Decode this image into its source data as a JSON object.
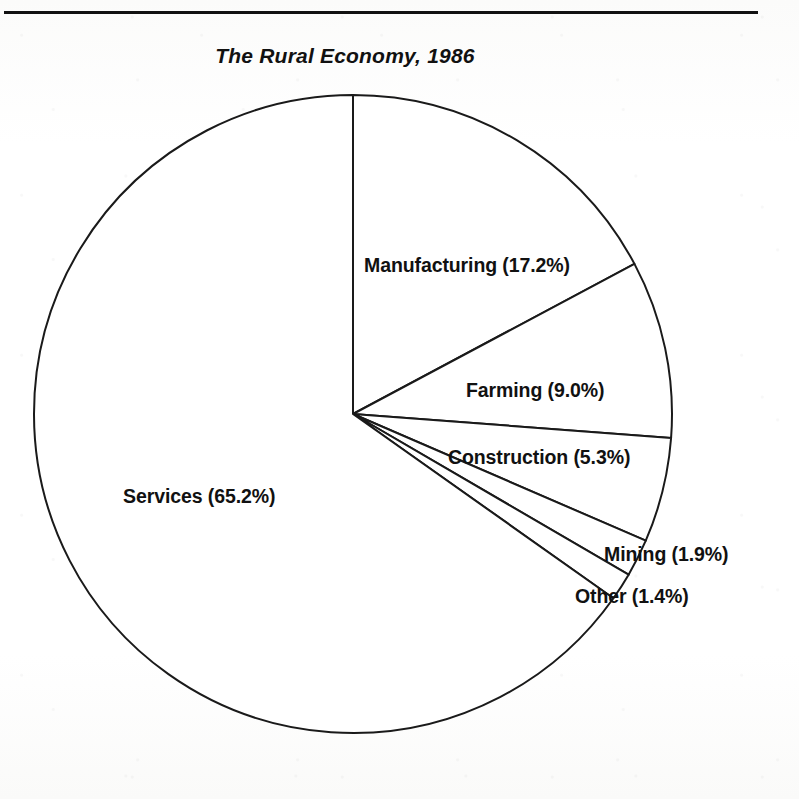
{
  "page": {
    "background_color": "#fdfdfc",
    "ink_color": "#111111",
    "top_rule": "horizontal-rule"
  },
  "chart_data": {
    "type": "pie",
    "title": "The Rural Economy, 1986",
    "xlabel": "",
    "ylabel": "",
    "grid": false,
    "legend_position": "none",
    "labels_inline": true,
    "units": "percent",
    "start_angle_deg": 0,
    "direction": "clockwise",
    "center": {
      "x": 353,
      "y": 414
    },
    "radius": 319,
    "categories": [
      "Manufacturing",
      "Farming",
      "Construction",
      "Mining",
      "Other",
      "Services"
    ],
    "values": [
      17.2,
      9.0,
      5.3,
      1.9,
      1.4,
      65.2
    ],
    "slices": [
      {
        "name": "Manufacturing",
        "value": 17.2,
        "label": "Manufacturing (17.2%)",
        "fill": "#ffffff",
        "stroke": "#1a1a1a"
      },
      {
        "name": "Farming",
        "value": 9.0,
        "label": "Farming (9.0%)",
        "fill": "#ffffff",
        "stroke": "#1a1a1a"
      },
      {
        "name": "Construction",
        "value": 5.3,
        "label": "Construction (5.3%)",
        "fill": "#ffffff",
        "stroke": "#1a1a1a"
      },
      {
        "name": "Mining",
        "value": 1.9,
        "label": "Mining (1.9%)",
        "fill": "#ffffff",
        "stroke": "#1a1a1a"
      },
      {
        "name": "Other",
        "value": 1.4,
        "label": "Other (1.4%)",
        "fill": "#ffffff",
        "stroke": "#1a1a1a"
      },
      {
        "name": "Services",
        "value": 65.2,
        "label": "Services (65.2%)",
        "fill": "#ffffff",
        "stroke": "#1a1a1a"
      }
    ]
  }
}
